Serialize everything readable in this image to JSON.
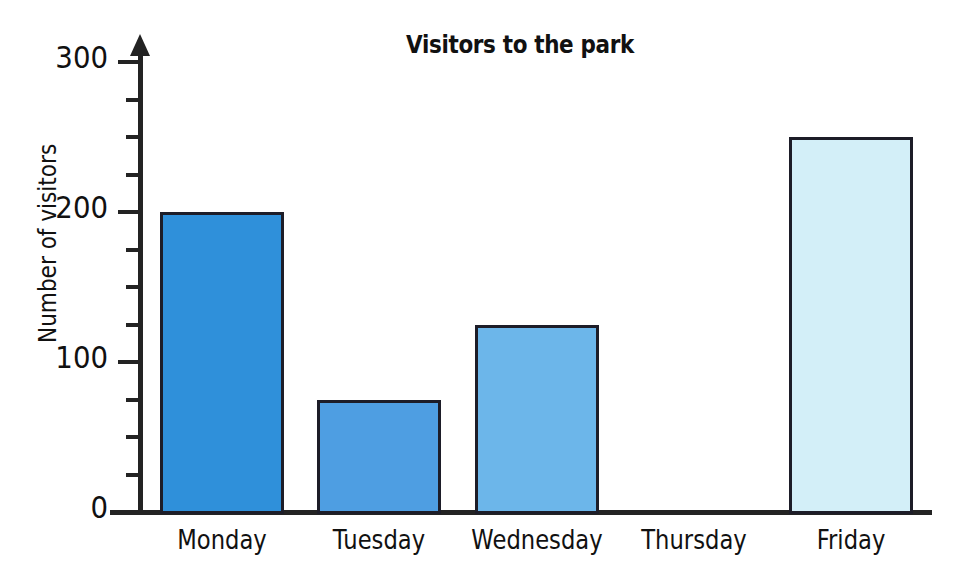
{
  "chart_data": {
    "type": "bar",
    "title": "Visitors to the park",
    "xlabel": "",
    "ylabel": "Number of visitors",
    "categories": [
      "Monday",
      "Tuesday",
      "Wednesday",
      "Thursday",
      "Friday"
    ],
    "values": [
      200,
      75,
      125,
      0,
      250
    ],
    "ylim": [
      0,
      300
    ],
    "y_major_ticks": [
      0,
      100,
      200,
      300
    ],
    "y_tick_labels": [
      "0",
      "100",
      "200",
      "300"
    ],
    "y_minor_tick_interval": 25,
    "grid": false,
    "legend": false,
    "bar_colors": [
      "#2f90da",
      "#4e9ee2",
      "#6cb6ea",
      "none",
      "#d3eff8"
    ],
    "bar_border_color": "#1d1d28",
    "axis_color": "#232323",
    "background": "#ffffff"
  }
}
